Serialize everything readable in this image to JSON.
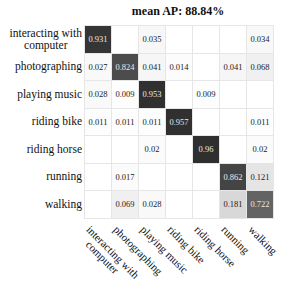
{
  "chart_data": {
    "type": "heatmap",
    "title": "mean AP: 88.84%",
    "row_labels": [
      "interacting with computer",
      "photographing",
      "playing music",
      "riding bike",
      "riding horse",
      "running",
      "walking"
    ],
    "col_labels": [
      "interacting with computer",
      "photographing",
      "playing music",
      "riding bike",
      "riding horse",
      "running",
      "walking"
    ],
    "values": [
      [
        0.931,
        null,
        0.035,
        null,
        null,
        null,
        0.034
      ],
      [
        0.027,
        0.824,
        0.041,
        0.014,
        null,
        0.041,
        0.068
      ],
      [
        0.028,
        0.009,
        0.953,
        null,
        0.009,
        null,
        null
      ],
      [
        0.011,
        0.011,
        0.011,
        0.957,
        null,
        null,
        0.011
      ],
      [
        null,
        null,
        0.02,
        null,
        0.96,
        null,
        0.02
      ],
      [
        null,
        0.017,
        null,
        null,
        null,
        0.862,
        0.121
      ],
      [
        null,
        0.069,
        0.028,
        null,
        null,
        0.181,
        0.722
      ]
    ],
    "colormap": "gray_reversed",
    "xlabel": "",
    "ylabel": ""
  },
  "display": {
    "title": "mean AP: 88.84%",
    "rows": [
      {
        "line1": "interacting with",
        "line2": "computer"
      },
      {
        "line1": "photographing"
      },
      {
        "line1": "playing music"
      },
      {
        "line1": "riding bike"
      },
      {
        "line1": "riding horse"
      },
      {
        "line1": "running"
      },
      {
        "line1": "walking"
      }
    ],
    "cols": [
      {
        "line1": "interacting with",
        "line2": "computer"
      },
      {
        "line1": "photographing"
      },
      {
        "line1": "playing music"
      },
      {
        "line1": "riding bike"
      },
      {
        "line1": "riding horse"
      },
      {
        "line1": "running"
      },
      {
        "line1": "walking"
      }
    ],
    "cells": [
      [
        "0.931",
        "",
        "0.035",
        "",
        "",
        "",
        "0.034"
      ],
      [
        "0.027",
        "0.824",
        "0.041",
        "0.014",
        "",
        "0.041",
        "0.068"
      ],
      [
        "0.028",
        "0.009",
        "0.953",
        "",
        "0.009",
        "",
        ""
      ],
      [
        "0.011",
        "0.011",
        "0.011",
        "0.957",
        "",
        "",
        "0.011"
      ],
      [
        "",
        "",
        "0.02",
        "",
        "0.96",
        "",
        "0.02"
      ],
      [
        "",
        "0.017",
        "",
        "",
        "",
        "0.862",
        "0.121"
      ],
      [
        "",
        "0.069",
        "0.028",
        "",
        "",
        "0.181",
        "0.722"
      ]
    ]
  }
}
